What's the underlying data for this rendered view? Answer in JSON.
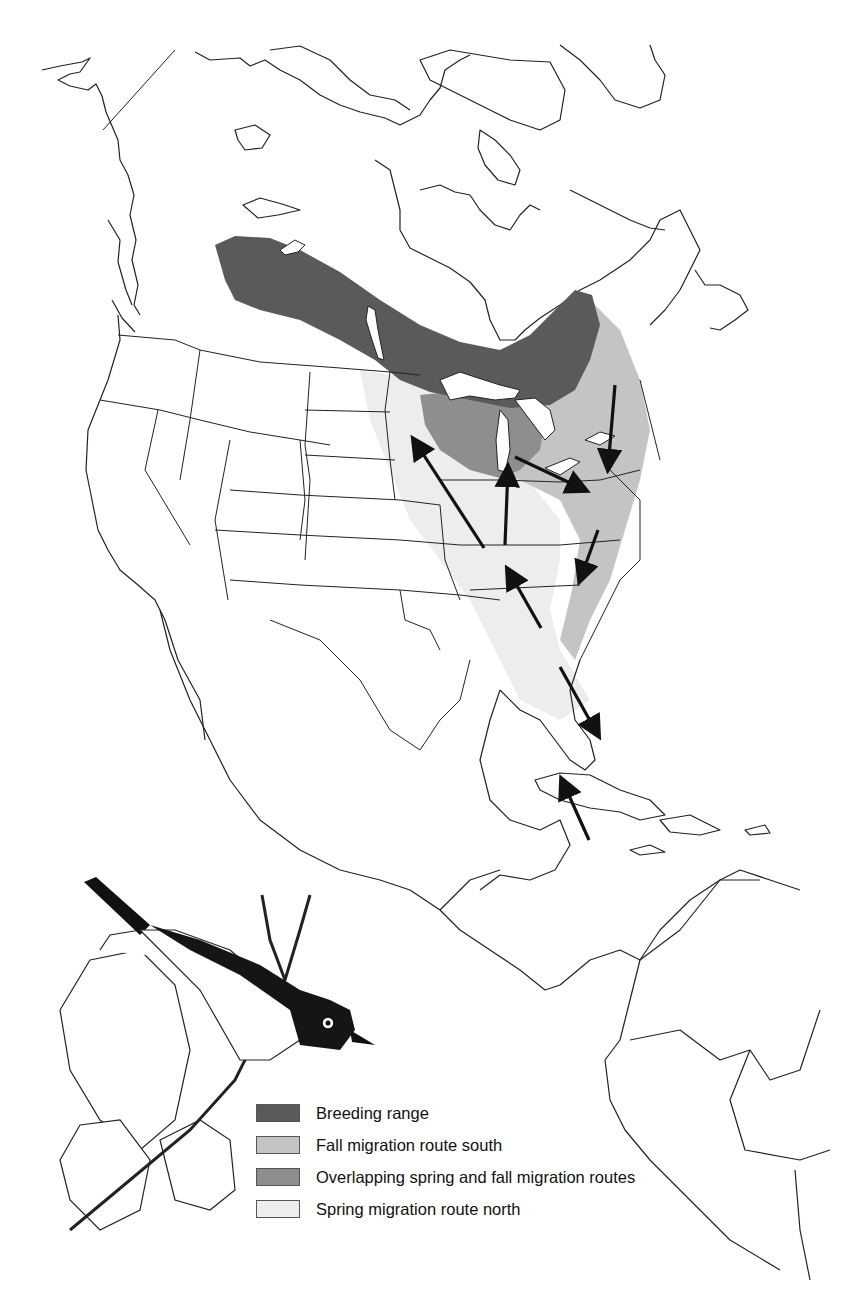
{
  "figure": {
    "type": "range-and-migration-map",
    "region": "North America, Central America, northern South America, Caribbean",
    "illustration": "bird-perched-on-branch-with-leaves"
  },
  "legend": {
    "items": [
      {
        "key": "breeding",
        "label": "Breeding range",
        "color": "#5a5a5a"
      },
      {
        "key": "fall",
        "label": "Fall migration route south",
        "color": "#c4c4c4"
      },
      {
        "key": "overlap",
        "label": "Overlapping spring and fall migration routes",
        "color": "#8e8e8e"
      },
      {
        "key": "spring",
        "label": "Spring migration route north",
        "color": "#ededed"
      }
    ]
  },
  "arrows": [
    {
      "direction": "north",
      "from": [
        484,
        548
      ],
      "to": [
        414,
        440
      ]
    },
    {
      "direction": "north",
      "from": [
        505,
        545
      ],
      "to": [
        508,
        468
      ]
    },
    {
      "direction": "southeast",
      "from": [
        515,
        457
      ],
      "to": [
        585,
        490
      ]
    },
    {
      "direction": "south",
      "from": [
        615,
        385
      ],
      "to": [
        608,
        468
      ]
    },
    {
      "direction": "south",
      "from": [
        598,
        530
      ],
      "to": [
        580,
        580
      ]
    },
    {
      "direction": "northwest",
      "from": [
        541,
        628
      ],
      "to": [
        508,
        570
      ]
    },
    {
      "direction": "southeast",
      "from": [
        560,
        667
      ],
      "to": [
        598,
        735
      ]
    },
    {
      "direction": "northwest",
      "from": [
        589,
        840
      ],
      "to": [
        562,
        780
      ]
    }
  ]
}
